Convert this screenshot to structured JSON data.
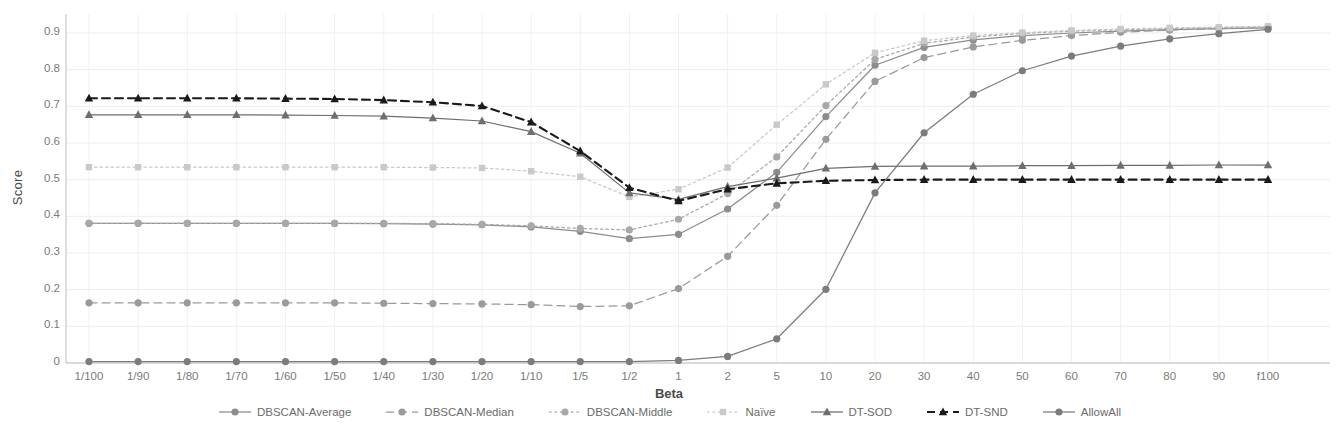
{
  "chart_data": {
    "type": "line",
    "title": "",
    "xlabel": "Beta",
    "ylabel": "Score",
    "grid": true,
    "legend_position": "bottom",
    "ylim": [
      0,
      0.95
    ],
    "yticks": [
      0,
      0.1,
      0.2,
      0.3,
      0.4,
      0.5,
      0.6,
      0.7,
      0.8,
      0.9
    ],
    "ytick_labels": [
      "0",
      "0.1",
      "0.2",
      "0.3",
      "0.4",
      "0.5",
      "0.6",
      "0.7",
      "0.8",
      "0.9"
    ],
    "categories": [
      "1/100",
      "1/90",
      "1/80",
      "1/70",
      "1/60",
      "1/50",
      "1/40",
      "1/30",
      "1/20",
      "1/10",
      "1/5",
      "1/2",
      "1",
      "2",
      "5",
      "10",
      "20",
      "30",
      "40",
      "50",
      "60",
      "70",
      "80",
      "90",
      "f100"
    ],
    "series": [
      {
        "name": "DBSCAN-Average",
        "color": "#8c8c8c",
        "marker": "circle",
        "dash": "solid",
        "values": [
          0.381,
          0.381,
          0.381,
          0.381,
          0.381,
          0.381,
          0.38,
          0.379,
          0.377,
          0.371,
          0.359,
          0.339,
          0.351,
          0.42,
          0.52,
          0.672,
          0.812,
          0.861,
          0.881,
          0.893,
          0.9,
          0.905,
          0.909,
          0.912,
          0.914
        ]
      },
      {
        "name": "DBSCAN-Median",
        "color": "#9a9a9a",
        "marker": "circle",
        "dash": "dashed",
        "values": [
          0.164,
          0.164,
          0.164,
          0.164,
          0.164,
          0.164,
          0.163,
          0.162,
          0.161,
          0.159,
          0.154,
          0.156,
          0.203,
          0.291,
          0.43,
          0.61,
          0.768,
          0.833,
          0.862,
          0.88,
          0.893,
          0.902,
          0.908,
          0.912,
          0.915
        ]
      },
      {
        "name": "DBSCAN-Middle",
        "color": "#a8a8a8",
        "marker": "circle",
        "dash": "dotted",
        "values": [
          0.381,
          0.381,
          0.381,
          0.381,
          0.381,
          0.381,
          0.381,
          0.38,
          0.378,
          0.374,
          0.367,
          0.363,
          0.392,
          0.462,
          0.562,
          0.702,
          0.828,
          0.872,
          0.889,
          0.899,
          0.905,
          0.909,
          0.912,
          0.915,
          0.917
        ]
      },
      {
        "name": "Naïve",
        "color": "#c9c9c9",
        "marker": "square",
        "dash": "dotted",
        "values": [
          0.534,
          0.534,
          0.534,
          0.534,
          0.534,
          0.534,
          0.534,
          0.533,
          0.532,
          0.523,
          0.508,
          0.453,
          0.474,
          0.533,
          0.65,
          0.76,
          0.846,
          0.879,
          0.893,
          0.901,
          0.907,
          0.911,
          0.914,
          0.916,
          0.918
        ]
      },
      {
        "name": "DT-SOD",
        "color": "#6e6e6e",
        "marker": "triangle",
        "dash": "solid",
        "values": [
          0.677,
          0.677,
          0.677,
          0.677,
          0.676,
          0.675,
          0.673,
          0.668,
          0.66,
          0.631,
          0.572,
          0.464,
          0.446,
          0.481,
          0.504,
          0.531,
          0.536,
          0.537,
          0.537,
          0.538,
          0.538,
          0.539,
          0.539,
          0.54,
          0.54
        ]
      },
      {
        "name": "DT-SND",
        "color": "#1a1a1a",
        "marker": "triangle",
        "dash": "dashed",
        "values": [
          0.722,
          0.722,
          0.722,
          0.722,
          0.721,
          0.72,
          0.717,
          0.711,
          0.701,
          0.657,
          0.578,
          0.478,
          0.442,
          0.474,
          0.49,
          0.497,
          0.499,
          0.5,
          0.5,
          0.5,
          0.5,
          0.5,
          0.5,
          0.5,
          0.5
        ]
      },
      {
        "name": "AllowAll",
        "color": "#7c7c7c",
        "marker": "circle",
        "dash": "solid",
        "values": [
          0.004,
          0.004,
          0.004,
          0.004,
          0.004,
          0.004,
          0.004,
          0.004,
          0.004,
          0.004,
          0.004,
          0.004,
          0.007,
          0.018,
          0.066,
          0.201,
          0.464,
          0.628,
          0.733,
          0.797,
          0.837,
          0.864,
          0.884,
          0.898,
          0.91
        ]
      }
    ]
  },
  "axes": {
    "x_title": "Beta",
    "y_title": "Score"
  },
  "legend": {
    "items": [
      {
        "label": "DBSCAN-Average",
        "icon": "line-circle-solid-icon"
      },
      {
        "label": "DBSCAN-Median",
        "icon": "line-circle-dashed-icon"
      },
      {
        "label": "DBSCAN-Middle",
        "icon": "line-circle-dotted-icon"
      },
      {
        "label": "Naïve",
        "icon": "line-square-dotted-icon"
      },
      {
        "label": "DT-SOD",
        "icon": "line-triangle-solid-icon"
      },
      {
        "label": "DT-SND",
        "icon": "line-triangle-dashed-icon"
      },
      {
        "label": "AllowAll",
        "icon": "line-circle-solid-icon"
      }
    ]
  }
}
